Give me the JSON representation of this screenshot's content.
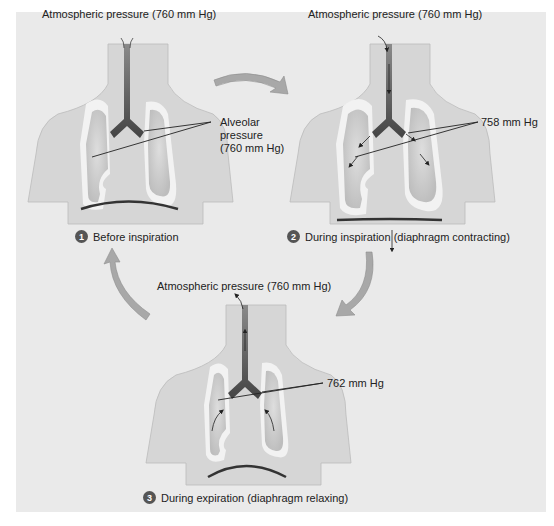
{
  "panels": [
    {
      "id": "before",
      "atmospheric_label": "Atmospheric pressure (760 mm Hg)",
      "alveolar_label_lines": [
        "Alveolar",
        "pressure",
        "(760 mm Hg)"
      ],
      "step_number": "1",
      "step_label": "Before inspiration"
    },
    {
      "id": "inspiration",
      "atmospheric_label": "Atmospheric pressure (760 mm Hg)",
      "alveolar_label": "758 mm Hg",
      "step_number": "2",
      "step_label": "During inspiration (diaphragm contracting)"
    },
    {
      "id": "expiration",
      "atmospheric_label": "Atmospheric pressure (760 mm Hg)",
      "alveolar_label": "762 mm Hg",
      "step_number": "3",
      "step_label": "During expiration (diaphragm relaxing)"
    }
  ],
  "colors": {
    "background": "#eaeaea",
    "body": "#d6d6d6",
    "lung_outline": "#f2f2f2",
    "lung": "#c4c4c4",
    "airway": "#555555",
    "cycle_arrow": "#a8a8a8"
  }
}
